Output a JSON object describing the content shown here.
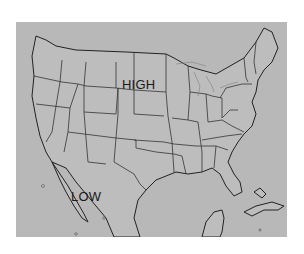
{
  "map": {
    "region": "Continental United States",
    "background_color": "#b8b8b8",
    "border_color": "#2a2a2a",
    "labels": {
      "high": "HIGH",
      "low": "LOW"
    }
  }
}
